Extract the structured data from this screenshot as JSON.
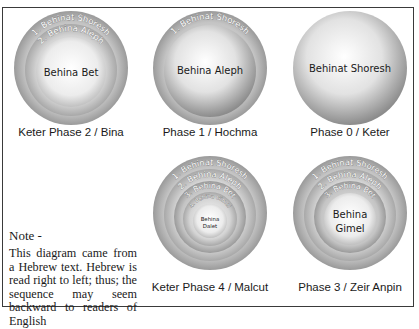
{
  "figure": {
    "frame_color": "#3a3a3a",
    "note": {
      "title": "Note -",
      "body": "This diagram came from a Hebrew text. Hebrew is read right to left; thus; the sequence may seem backward to readers of English"
    },
    "diagrams": [
      {
        "id": "keter-phase-2",
        "caption": "Keter Phase 2 / Bina",
        "rings": [
          "1. Behinat Shoresh",
          "2. Behina Aleph"
        ],
        "center_label": "Behina Bet"
      },
      {
        "id": "phase-1",
        "caption": "Phase 1 / Hochma",
        "rings": [
          "1. Behinat Shoresh"
        ],
        "center_label": "Behina Aleph"
      },
      {
        "id": "phase-0",
        "caption": "Phase 0 / Keter",
        "rings": [],
        "center_label": "Behinat Shoresh"
      },
      {
        "id": "keter-phase-4",
        "caption": "Keter Phase 4 / Malcut",
        "rings": [
          "1. Behinat Shoresh",
          "2. Behina Aleph",
          "3. Behina Bet",
          "4. Behina Gimel"
        ],
        "center_label_lines": [
          "Behina",
          "Dalet"
        ]
      },
      {
        "id": "phase-3",
        "caption": "Phase 3 / Zeir Anpin",
        "rings": [
          "1. Behinat Shoresh",
          "2. Behina Aleph",
          "3. Behina Bet"
        ],
        "center_label_lines": [
          "Behina",
          "Gimel"
        ]
      }
    ]
  }
}
